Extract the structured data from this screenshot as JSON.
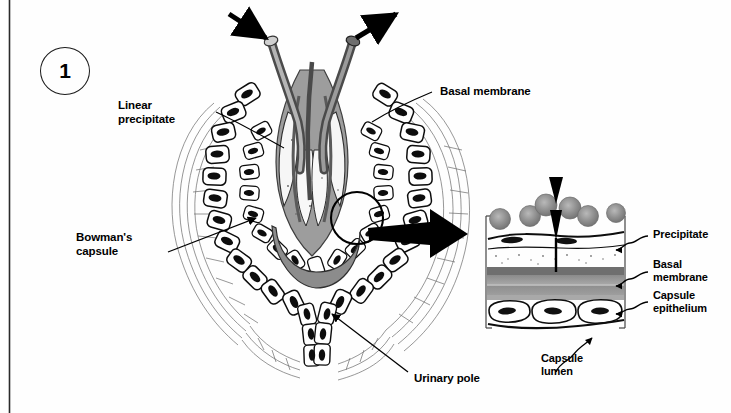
{
  "figure": {
    "number": "1",
    "kind": "anatomical-illustration",
    "background_color": "#fefefe",
    "ink_color": "#000000",
    "gray_tone": "#8d8d8d",
    "light_gray_tone": "#c9c9c9"
  },
  "labels": {
    "linear_precipitate": "Linear\nprecipitate",
    "basal_membrane_main": "Basal membrane",
    "bowmans_capsule": "Bowman's\ncapsule",
    "urinary_pole": "Urinary pole",
    "precipitate_inset": "Precipitate",
    "basal_membrane_inset": "Basal\nmembrane",
    "capsule_epithelium": "Capsule\nepithelium",
    "capsule_lumen": "Capsule\nlumen"
  },
  "inset": {
    "layers": [
      {
        "name": "blood-cells",
        "tone": "#8f8f8f",
        "count": 7
      },
      {
        "name": "endothelium",
        "tone": "#ffffff"
      },
      {
        "name": "precipitate-band",
        "tone": "#4a4a4a"
      },
      {
        "name": "basal-membrane-band",
        "tone": "#9a9a9a"
      },
      {
        "name": "capsule-epithelium",
        "tone": "#ffffff"
      }
    ]
  }
}
